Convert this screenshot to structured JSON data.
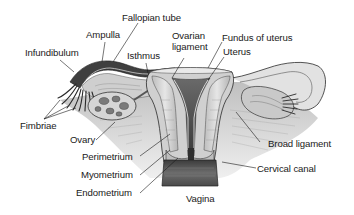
{
  "diagram": {
    "colors": {
      "ink": "#1a1a1a",
      "tissue_light": "#d8d8d8",
      "tissue_mid": "#a8a8a8",
      "tissue_dark": "#4a4a4a",
      "background": "#ffffff"
    },
    "labels": [
      {
        "id": "fallopian-tube",
        "text": "Fallopian tube"
      },
      {
        "id": "ampulla",
        "text": "Ampulla"
      },
      {
        "id": "infundibulum",
        "text": "Infundibulum"
      },
      {
        "id": "ovarian-ligament-1",
        "text": "Ovarian"
      },
      {
        "id": "ovarian-ligament-2",
        "text": "ligament"
      },
      {
        "id": "isthmus",
        "text": "Isthmus"
      },
      {
        "id": "fundus",
        "text": "Fundus of uterus"
      },
      {
        "id": "uterus",
        "text": "Uterus"
      },
      {
        "id": "fimbriae",
        "text": "Fimbriae"
      },
      {
        "id": "ovary",
        "text": "Ovary"
      },
      {
        "id": "perimetrium",
        "text": "Perimetrium"
      },
      {
        "id": "myometrium",
        "text": "Myometrium"
      },
      {
        "id": "endometrium",
        "text": "Endometrium"
      },
      {
        "id": "broad-ligament",
        "text": "Broad ligament"
      },
      {
        "id": "cervical-canal",
        "text": "Cervical canal"
      },
      {
        "id": "vagina",
        "text": "Vagina"
      }
    ]
  }
}
